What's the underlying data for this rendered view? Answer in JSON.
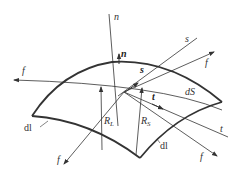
{
  "figure": {
    "colors": {
      "line": "#333333",
      "background": "#ffffff"
    },
    "labels": {
      "n_axis": "n",
      "n_vec": "n",
      "s_axis": "s",
      "s_vec": "s",
      "t_axis": "t",
      "t_vec": "t",
      "f_left": "f",
      "f_top_right": "f",
      "f_bottom_left": "f",
      "f_bottom_right": "f",
      "dS": "dS",
      "dl_left": "dl",
      "dl_right": "dl",
      "R_L": "R",
      "R_L_sub": "L",
      "R_S": "R",
      "R_S_sub": "S"
    }
  }
}
